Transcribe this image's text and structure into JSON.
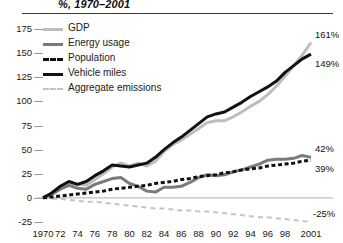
{
  "chart_data": {
    "type": "line",
    "title": "%, 1970–2001",
    "xlabel": "",
    "ylabel": "",
    "ylim": [
      -25,
      175
    ],
    "yticks": [
      175,
      150,
      125,
      100,
      75,
      50,
      25,
      0,
      -25
    ],
    "xlim": [
      1970,
      2001
    ],
    "x": [
      1970,
      1971,
      1972,
      1973,
      1974,
      1975,
      1976,
      1977,
      1978,
      1979,
      1980,
      1981,
      1982,
      1983,
      1984,
      1985,
      1986,
      1987,
      1988,
      1989,
      1990,
      1991,
      1992,
      1993,
      1994,
      1995,
      1996,
      1997,
      1998,
      1999,
      2000,
      2001
    ],
    "xticklabels": [
      "1970",
      "72",
      "74",
      "76",
      "78",
      "80",
      "82",
      "84",
      "86",
      "88",
      "90",
      "92",
      "94",
      "96",
      "98",
      "2001"
    ],
    "xticks": [
      1970,
      1972,
      1974,
      1976,
      1978,
      1980,
      1982,
      1984,
      1986,
      1988,
      1990,
      1992,
      1994,
      1996,
      1998,
      2001
    ],
    "grid": false,
    "legend_position": "upper left",
    "series": [
      {
        "name": "GDP",
        "color": "#bdbdbd",
        "style": "solid",
        "width": 3,
        "end_label": "161%",
        "values": [
          0,
          3,
          9,
          15,
          14,
          13,
          19,
          25,
          32,
          36,
          33,
          36,
          33,
          38,
          48,
          55,
          60,
          66,
          72,
          78,
          80,
          80,
          84,
          89,
          95,
          100,
          107,
          116,
          126,
          137,
          148,
          161
        ]
      },
      {
        "name": "Energy usage",
        "color": "#7a7a7a",
        "style": "solid",
        "width": 3,
        "end_label": "42%",
        "values": [
          0,
          4,
          9,
          13,
          10,
          9,
          14,
          17,
          20,
          21,
          15,
          12,
          7,
          6,
          11,
          11,
          12,
          16,
          21,
          24,
          23,
          24,
          27,
          29,
          32,
          35,
          39,
          40,
          40,
          41,
          44,
          42
        ]
      },
      {
        "name": "Population",
        "color": "#111111",
        "style": "dashed",
        "width": 3,
        "end_label": "39%",
        "values": [
          0,
          1,
          2,
          3,
          4,
          5,
          6,
          7,
          9,
          10,
          11,
          12,
          13,
          15,
          16,
          17,
          19,
          20,
          22,
          23,
          24,
          26,
          27,
          29,
          30,
          31,
          33,
          34,
          35,
          36,
          38,
          39
        ]
      },
      {
        "name": "Vehicle miles",
        "color": "#111111",
        "style": "solid",
        "width": 3,
        "end_label": "149%",
        "values": [
          0,
          5,
          12,
          17,
          14,
          17,
          23,
          28,
          34,
          33,
          32,
          34,
          36,
          42,
          50,
          57,
          63,
          70,
          77,
          84,
          87,
          89,
          94,
          99,
          105,
          110,
          115,
          121,
          130,
          137,
          144,
          149
        ]
      },
      {
        "name": "Aggregate emissions",
        "color": "#c4c4c4",
        "style": "dashed",
        "width": 2,
        "end_label": "-25%",
        "values": [
          0,
          -1,
          -1,
          -2,
          -3,
          -4,
          -4,
          -5,
          -6,
          -7,
          -8,
          -9,
          -10,
          -11,
          -11,
          -12,
          -13,
          -13,
          -14,
          -14,
          -15,
          -16,
          -17,
          -18,
          -19,
          -20,
          -20,
          -21,
          -22,
          -23,
          -24,
          -25
        ]
      }
    ]
  }
}
